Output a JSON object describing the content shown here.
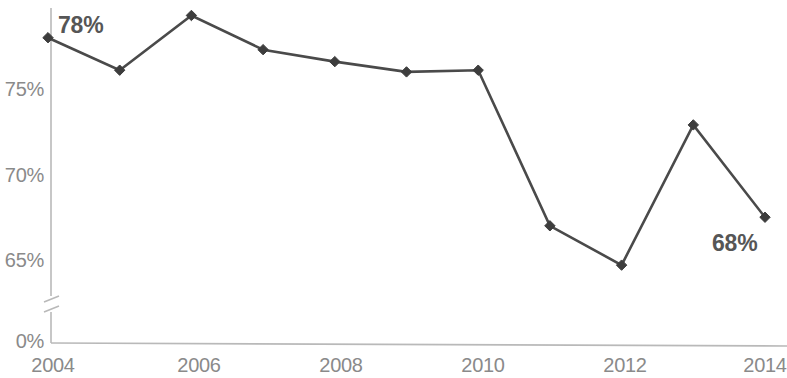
{
  "chart_data": {
    "type": "line",
    "title": "",
    "subtitle": "",
    "xlabel": "",
    "ylabel": "",
    "x": [
      2004,
      2005,
      2006,
      2007,
      2008,
      2009,
      2010,
      2011,
      2012,
      2013,
      2014
    ],
    "categories": [
      "2004",
      "2005",
      "2006",
      "2007",
      "2008",
      "2009",
      "2010",
      "2011",
      "2012",
      "2013",
      "2014"
    ],
    "values": [
      78.0,
      76.1,
      79.3,
      77.3,
      76.6,
      76.0,
      76.1,
      67.0,
      64.7,
      72.9,
      67.5
    ],
    "series": [
      {
        "name": "",
        "values": [
          78.0,
          76.1,
          79.3,
          77.3,
          76.6,
          76.0,
          76.1,
          67.0,
          64.7,
          72.9,
          67.5
        ]
      }
    ],
    "ylim": [
      63.5,
      80.5
    ],
    "xlim": [
      2004,
      2014
    ],
    "y_tick_labels": [
      "75%",
      "70%",
      "65%",
      "0%"
    ],
    "y_tick_values": [
      75,
      70,
      65,
      0
    ],
    "x_tick_labels": [
      "2004",
      "2006",
      "2008",
      "2010",
      "2012",
      "2014"
    ],
    "x_tick_values": [
      2004,
      2006,
      2008,
      2010,
      2012,
      2014
    ],
    "grid": false,
    "legend": "none",
    "axis_break": true,
    "annotations": [
      {
        "text": "78%",
        "x": 2004,
        "y": 78.0,
        "position": "above-right"
      },
      {
        "text": "68%",
        "x": 2014,
        "y": 67.5,
        "position": "below-left"
      }
    ],
    "colors": {
      "line": "#4a4a4a",
      "marker": "#3d3d3d",
      "axis": "#b9b9b9",
      "tick_text": "#8a8a8a",
      "annotation_text": "#565656",
      "background": "#ffffff"
    }
  },
  "axis": {
    "y_labels": [
      {
        "text": "75%",
        "y": 89
      },
      {
        "text": "70%",
        "y": 175
      },
      {
        "text": "65%",
        "y": 260
      },
      {
        "text": "0%",
        "y": 343
      }
    ],
    "x_labels": [
      {
        "text": "2004",
        "x": 48
      },
      {
        "text": "2006",
        "x": 196
      },
      {
        "text": "2008",
        "x": 340
      },
      {
        "text": "2010",
        "x": 481
      },
      {
        "text": "2012",
        "x": 622
      },
      {
        "text": "2014",
        "x": 765
      }
    ]
  },
  "annotations": {
    "start_label": "78%",
    "end_label": "68%"
  }
}
